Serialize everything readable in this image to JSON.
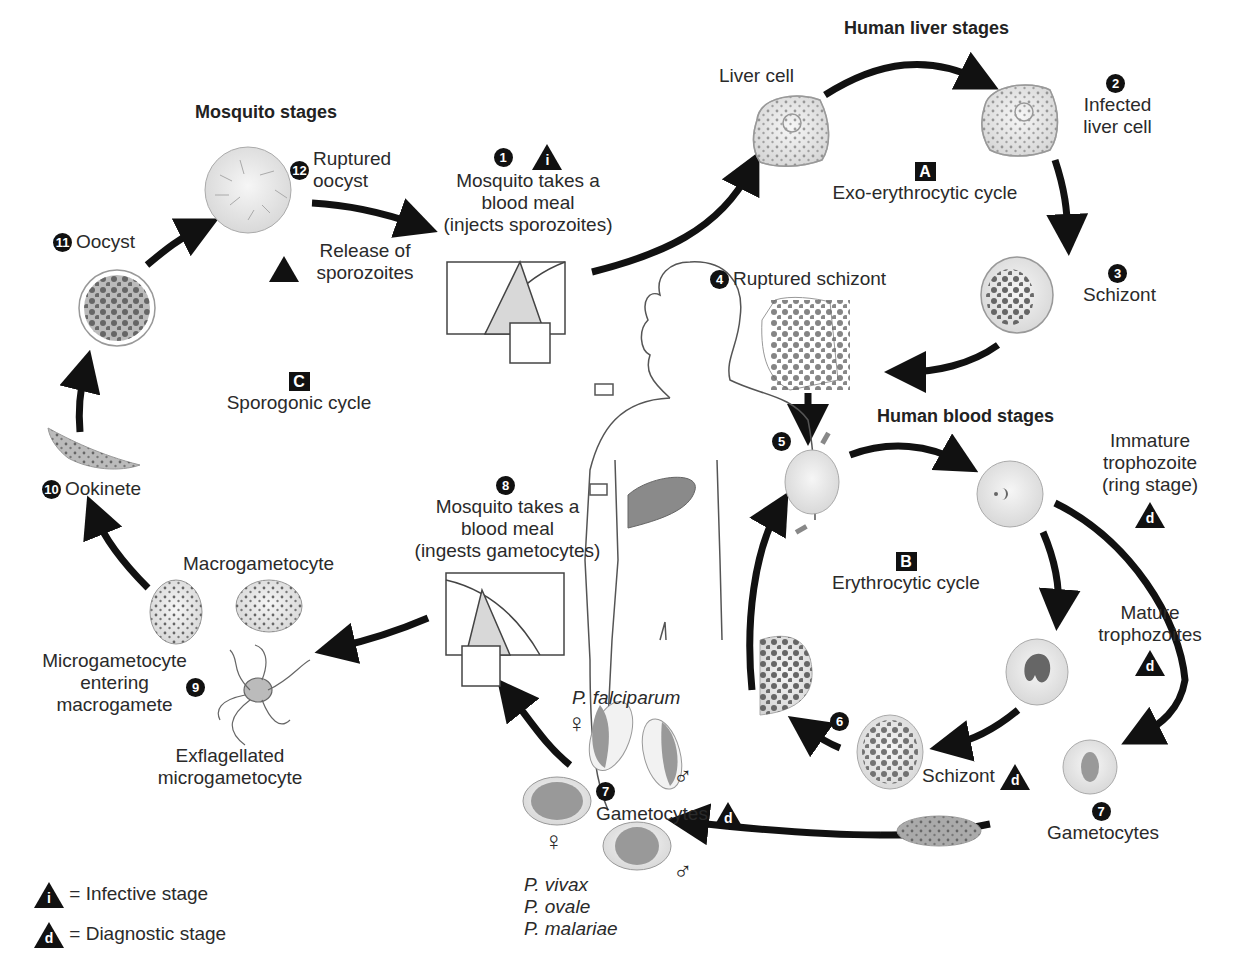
{
  "headers": {
    "mosquito": "Mosquito stages",
    "liver": "Human liver stages",
    "blood": "Human blood stages"
  },
  "cycles": {
    "a": {
      "letter": "A",
      "name": "Exo-erythrocytic cycle"
    },
    "b": {
      "letter": "B",
      "name": "Erythrocytic cycle"
    },
    "c": {
      "letter": "C",
      "name": "Sporogonic cycle"
    }
  },
  "stages": [
    {
      "num": "1",
      "lines": [
        "Mosquito takes a",
        "blood meal",
        "(injects sporozoites)"
      ],
      "marker": "i"
    },
    {
      "num": "2",
      "lines": [
        "Infected",
        "liver cell"
      ]
    },
    {
      "num": "3",
      "lines": [
        "Schizont"
      ]
    },
    {
      "num": "4",
      "lines": [
        "Ruptured schizont"
      ]
    },
    {
      "num": "5",
      "lines": []
    },
    {
      "num": "6",
      "lines": []
    },
    {
      "num": "7",
      "lines": [
        "Gametocytes"
      ],
      "marker": "d"
    },
    {
      "num": "8",
      "lines": [
        "Mosquito takes a",
        "blood meal",
        "(ingests gametocytes)"
      ]
    },
    {
      "num": "9",
      "lines": []
    },
    {
      "num": "10",
      "lines": [
        "Ookinete"
      ]
    },
    {
      "num": "11",
      "lines": [
        "Oocyst"
      ]
    },
    {
      "num": "12",
      "lines": [
        "Ruptured",
        "oocyst"
      ]
    }
  ],
  "labels": {
    "liver_cell": "Liver cell",
    "release": [
      "Release of",
      "sporozoites"
    ],
    "immature": [
      "Immature",
      "trophozoite",
      "(ring stage)"
    ],
    "mature": [
      "Mature",
      "trophozoites"
    ],
    "schizont_blood": "Schizont",
    "gametocytes_right": "Gametocytes",
    "gametocytes_center": "Gametocytes",
    "macrogametocyte": "Macrogametocyte",
    "micro_entering": [
      "Microgametocyte",
      "entering",
      "macrogamete"
    ],
    "exflagellated": [
      "Exflagellated",
      "microgametocyte"
    ],
    "falciparum": "P. falciparum",
    "other_species": [
      "P. vivax",
      "P. ovale",
      "P. malariae"
    ],
    "female_symbol": "♀",
    "male_symbol": "♂"
  },
  "legend": [
    {
      "marker": "i",
      "text": "= Infective stage"
    },
    {
      "marker": "d",
      "text": "= Diagnostic stage"
    }
  ],
  "colors": {
    "arrow": "#111111",
    "cell_fill": "#e6e6e6",
    "dot": "#6e6e6e",
    "liver_organ": "#8a8a8a"
  }
}
